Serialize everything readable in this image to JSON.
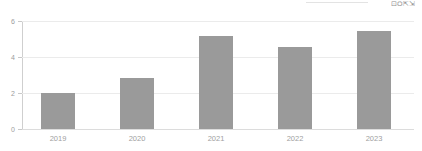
{
  "toolbar": {
    "glyph_label": "⊡⛭⇱⇲"
  },
  "chart_data": {
    "type": "bar",
    "title": "",
    "subtitle": "",
    "xlabel": "",
    "ylabel": "",
    "categories": [
      "2019",
      "2020",
      "2021",
      "2022",
      "2023"
    ],
    "values": [
      2.0,
      2.85,
      5.15,
      4.55,
      5.45
    ],
    "series": [
      {
        "name": "",
        "values": [
          2.0,
          2.85,
          5.15,
          4.55,
          5.45
        ]
      }
    ],
    "ylim": [
      0,
      6
    ],
    "yticks": [
      0,
      2,
      4,
      6
    ],
    "ytick_labels": [
      "0",
      "2",
      "4",
      "6"
    ],
    "grid": true,
    "legend": false,
    "legend_position": "none",
    "annotations": [],
    "colors": {
      "bar": "#9a9a9a",
      "gridline": "#ebebeb",
      "baseline": "#dcdcdc",
      "axis": "#cfcfcf",
      "tick_text": "#9c9c9c",
      "category_text": "#a0a0a0",
      "background": "#ffffff"
    }
  }
}
